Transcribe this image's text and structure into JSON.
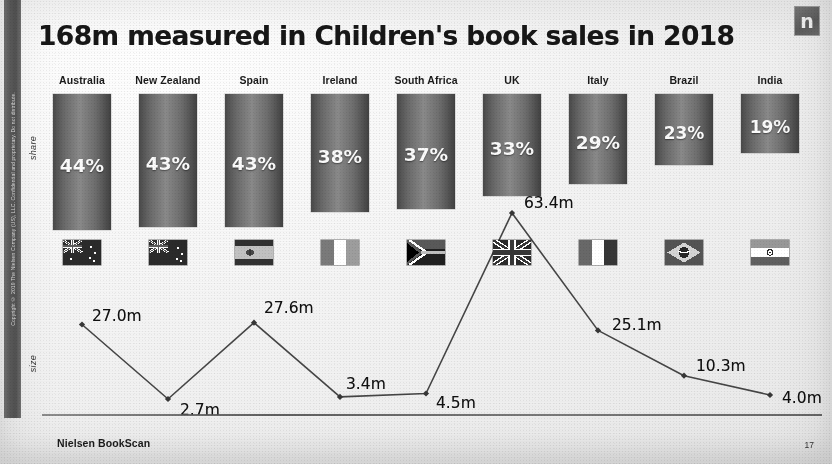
{
  "slide": {
    "title": "168m measured in Children's book sales in 2018",
    "logo_letter": "n",
    "source": "Nielsen BookScan",
    "page_number": "17",
    "sidebar_text": "Copyright © 2019 The Nielsen Company (US), LLC. Confidential and proprietary. Do not distribute."
  },
  "axes": {
    "share_label": "share",
    "size_label": "size"
  },
  "chart_data": {
    "type": "bar",
    "title": "168m measured in Children's book sales in 2018",
    "xlabel": "",
    "ylabel": "share",
    "categories": [
      "Australia",
      "New Zealand",
      "Spain",
      "Ireland",
      "South Africa",
      "UK",
      "Italy",
      "Brazil",
      "India"
    ],
    "series": [
      {
        "name": "share",
        "unit": "%",
        "values": [
          44,
          43,
          43,
          38,
          37,
          33,
          29,
          23,
          19
        ],
        "labels": [
          "44%",
          "43%",
          "43%",
          "38%",
          "37%",
          "33%",
          "29%",
          "23%",
          "19%"
        ]
      },
      {
        "name": "size",
        "unit": "m",
        "type": "line",
        "values": [
          27.0,
          2.7,
          27.6,
          3.4,
          4.5,
          63.4,
          25.1,
          10.3,
          4.0
        ],
        "labels": [
          "27.0m",
          "2.7m",
          "27.6m",
          "3.4m",
          "4.5m",
          "63.4m",
          "25.1m",
          "10.3m",
          "4.0m"
        ]
      }
    ],
    "ylim": [
      0,
      50
    ],
    "size_ylim": [
      0,
      70
    ],
    "grid": false,
    "legend": "none"
  },
  "columns": [
    {
      "name": "Australia",
      "share": "44%",
      "size": "27.0m",
      "flag": "flag-australia"
    },
    {
      "name": "New Zealand",
      "share": "43%",
      "size": "2.7m",
      "flag": "flag-new-zealand"
    },
    {
      "name": "Spain",
      "share": "43%",
      "size": "27.6m",
      "flag": "flag-spain"
    },
    {
      "name": "Ireland",
      "share": "38%",
      "size": "3.4m",
      "flag": "flag-ireland"
    },
    {
      "name": "South Africa",
      "share": "37%",
      "size": "4.5m",
      "flag": "flag-south-africa"
    },
    {
      "name": "UK",
      "share": "33%",
      "size": "63.4m",
      "flag": "flag-united-kingdom"
    },
    {
      "name": "Italy",
      "share": "29%",
      "size": "25.1m",
      "flag": "flag-italy"
    },
    {
      "name": "Brazil",
      "share": "23%",
      "size": "10.3m",
      "flag": "flag-brazil"
    },
    {
      "name": "India",
      "share": "19%",
      "size": "4.0m",
      "flag": "flag-india"
    }
  ]
}
